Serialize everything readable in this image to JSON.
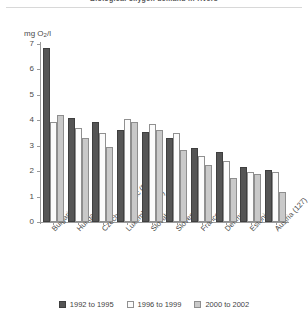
{
  "chart_data": {
    "type": "bar",
    "title": "Biological oxygen demand in rivers",
    "ylabel": "mg O2/l",
    "ylabel_prefix": "mg O",
    "ylabel_sub": "2",
    "ylabel_suffix": "/l",
    "xlabel": "",
    "ylim": [
      0,
      7
    ],
    "yticks": [
      0,
      1,
      2,
      3,
      4,
      5,
      6,
      7
    ],
    "ytick_labels": [
      "0",
      "1",
      "2",
      "3",
      "4",
      "5",
      "6",
      "7"
    ],
    "grid": false,
    "legend_position": "bottom",
    "categories": [
      "Bulgaria (44)",
      "Hungary (89)",
      "Czech Republic (58)",
      "Luxembourg (3)",
      "Slovakia (9)",
      "Slovenia (21)",
      "France (174)",
      "Denmark (11)",
      "Estonia(43)",
      "Austria (127)"
    ],
    "series": [
      {
        "name": "1992 to 1995",
        "color": "#555555",
        "values": [
          6.85,
          4.1,
          3.95,
          3.6,
          3.55,
          3.3,
          2.9,
          2.75,
          2.15,
          2.05
        ]
      },
      {
        "name": "1996 to 1999",
        "color": "#fbfbfb",
        "values": [
          3.95,
          3.7,
          3.5,
          4.05,
          3.85,
          3.5,
          2.6,
          2.4,
          1.95,
          1.95
        ]
      },
      {
        "name": "2000 to 2002",
        "color": "#c9c9c9",
        "values": [
          4.2,
          3.3,
          2.95,
          3.95,
          3.6,
          2.85,
          2.25,
          1.75,
          1.9,
          1.2
        ]
      }
    ]
  }
}
